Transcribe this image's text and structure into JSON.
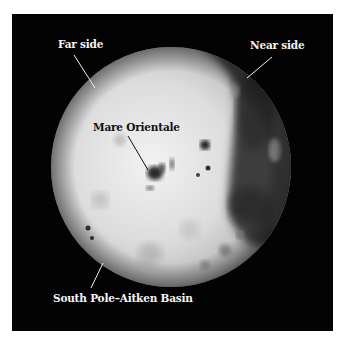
{
  "figure": {
    "background_color": "#030303",
    "labels": {
      "far_side": "Far side",
      "near_side": "Near side",
      "mare_orientale": "Mare Orientale",
      "south_pole_aitken": "South Pole–Aitken Basin"
    },
    "colors": {
      "label_light": "#f4f4f4",
      "label_dark": "#111111",
      "highlands": "#d9d9d9",
      "maria": "#3a3a3a"
    }
  }
}
